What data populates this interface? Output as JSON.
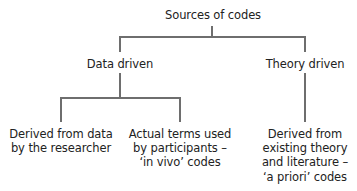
{
  "diagram": {
    "type": "tree",
    "line_color": "#6e6e6e",
    "root": {
      "label": "Sources of codes",
      "children": [
        {
          "label": "Data driven",
          "children": [
            {
              "lines": [
                "Derived from data",
                "by the researcher"
              ]
            },
            {
              "lines": [
                "Actual terms used",
                "by participants –",
                "‘in vivo’ codes"
              ]
            }
          ]
        },
        {
          "label": "Theory driven",
          "children": [
            {
              "lines": [
                "Derived from",
                "existing theory",
                "and literature –",
                "‘a priori’ codes"
              ]
            }
          ]
        }
      ]
    }
  }
}
